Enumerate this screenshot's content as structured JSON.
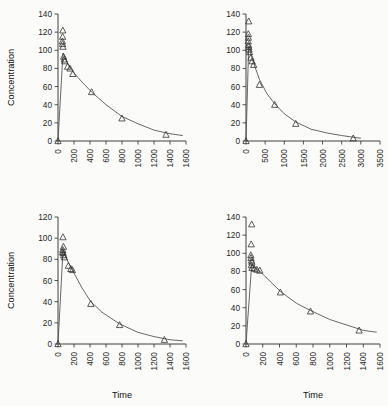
{
  "figure": {
    "marker_shape": "open-triangle",
    "curve_color": "#4d4d4d",
    "marker_color": "#333333",
    "background": "#fbfbf9"
  },
  "chart_data": [
    {
      "type": "scatter",
      "panel": "top-left",
      "title": "",
      "xlabel": "",
      "ylabel": "Concentration",
      "xlim": [
        0,
        1600
      ],
      "ylim": [
        0,
        140
      ],
      "xticks": [
        0,
        200,
        400,
        600,
        800,
        1000,
        1200,
        1400,
        1600
      ],
      "yticks": [
        0,
        20,
        40,
        60,
        80,
        100,
        120,
        140
      ],
      "grid": false,
      "legend": "none",
      "points": [
        {
          "x": 0,
          "y": 0
        },
        {
          "x": 60,
          "y": 122
        },
        {
          "x": 58,
          "y": 115
        },
        {
          "x": 55,
          "y": 110
        },
        {
          "x": 57,
          "y": 107
        },
        {
          "x": 62,
          "y": 104
        },
        {
          "x": 70,
          "y": 93
        },
        {
          "x": 78,
          "y": 90
        },
        {
          "x": 85,
          "y": 88
        },
        {
          "x": 120,
          "y": 82
        },
        {
          "x": 150,
          "y": 80
        },
        {
          "x": 185,
          "y": 74
        },
        {
          "x": 420,
          "y": 54
        },
        {
          "x": 800,
          "y": 25
        },
        {
          "x": 1350,
          "y": 7
        }
      ],
      "fit_curve": {
        "model": "exponential-decay",
        "points": [
          {
            "x": 62,
            "y": 97
          },
          {
            "x": 120,
            "y": 86
          },
          {
            "x": 200,
            "y": 75
          },
          {
            "x": 300,
            "y": 65
          },
          {
            "x": 420,
            "y": 54
          },
          {
            "x": 600,
            "y": 40
          },
          {
            "x": 800,
            "y": 27
          },
          {
            "x": 1000,
            "y": 19
          },
          {
            "x": 1200,
            "y": 12
          },
          {
            "x": 1400,
            "y": 8
          },
          {
            "x": 1560,
            "y": 6
          }
        ]
      }
    },
    {
      "type": "scatter",
      "panel": "top-right",
      "title": "",
      "xlabel": "",
      "ylabel": "",
      "xlim": [
        0,
        3500
      ],
      "ylim": [
        0,
        140
      ],
      "xticks": [
        0,
        500,
        1000,
        1500,
        2000,
        2500,
        3000,
        3500
      ],
      "yticks": [
        0,
        20,
        40,
        60,
        80,
        100,
        120,
        140
      ],
      "grid": false,
      "legend": "none",
      "points": [
        {
          "x": 0,
          "y": 0
        },
        {
          "x": 70,
          "y": 132
        },
        {
          "x": 60,
          "y": 118
        },
        {
          "x": 62,
          "y": 114
        },
        {
          "x": 58,
          "y": 110
        },
        {
          "x": 66,
          "y": 106
        },
        {
          "x": 72,
          "y": 104
        },
        {
          "x": 80,
          "y": 101
        },
        {
          "x": 95,
          "y": 98
        },
        {
          "x": 130,
          "y": 92
        },
        {
          "x": 160,
          "y": 88
        },
        {
          "x": 200,
          "y": 84
        },
        {
          "x": 350,
          "y": 62
        },
        {
          "x": 750,
          "y": 40
        },
        {
          "x": 1300,
          "y": 19
        },
        {
          "x": 2800,
          "y": 3
        }
      ],
      "fit_curve": {
        "model": "exponential-decay",
        "points": [
          {
            "x": 70,
            "y": 104
          },
          {
            "x": 200,
            "y": 86
          },
          {
            "x": 350,
            "y": 68
          },
          {
            "x": 550,
            "y": 52
          },
          {
            "x": 750,
            "y": 41
          },
          {
            "x": 1000,
            "y": 30
          },
          {
            "x": 1300,
            "y": 21
          },
          {
            "x": 1700,
            "y": 13
          },
          {
            "x": 2100,
            "y": 9
          },
          {
            "x": 2500,
            "y": 6
          },
          {
            "x": 3000,
            "y": 3
          }
        ]
      }
    },
    {
      "type": "scatter",
      "panel": "bottom-left",
      "title": "",
      "xlabel": "Time",
      "ylabel": "Concentration",
      "xlim": [
        0,
        1600
      ],
      "ylim": [
        0,
        120
      ],
      "xticks": [
        0,
        200,
        400,
        600,
        800,
        1000,
        1200,
        1400,
        1600
      ],
      "yticks": [
        0,
        20,
        40,
        60,
        80,
        100,
        120
      ],
      "grid": false,
      "legend": "none",
      "points": [
        {
          "x": 0,
          "y": 0
        },
        {
          "x": 62,
          "y": 101
        },
        {
          "x": 68,
          "y": 92
        },
        {
          "x": 60,
          "y": 89
        },
        {
          "x": 58,
          "y": 87
        },
        {
          "x": 64,
          "y": 86
        },
        {
          "x": 70,
          "y": 84
        },
        {
          "x": 80,
          "y": 82
        },
        {
          "x": 130,
          "y": 74
        },
        {
          "x": 160,
          "y": 71
        },
        {
          "x": 180,
          "y": 70
        },
        {
          "x": 410,
          "y": 38
        },
        {
          "x": 770,
          "y": 18
        },
        {
          "x": 1330,
          "y": 4
        }
      ],
      "fit_curve": {
        "model": "exponential-decay",
        "points": [
          {
            "x": 62,
            "y": 88
          },
          {
            "x": 130,
            "y": 77
          },
          {
            "x": 200,
            "y": 67
          },
          {
            "x": 300,
            "y": 53
          },
          {
            "x": 410,
            "y": 40
          },
          {
            "x": 550,
            "y": 30
          },
          {
            "x": 770,
            "y": 19
          },
          {
            "x": 1000,
            "y": 11
          },
          {
            "x": 1200,
            "y": 7
          },
          {
            "x": 1400,
            "y": 4
          },
          {
            "x": 1560,
            "y": 3
          }
        ]
      }
    },
    {
      "type": "scatter",
      "panel": "bottom-right",
      "title": "",
      "xlabel": "Time",
      "ylabel": "",
      "xlim": [
        0,
        1600
      ],
      "ylim": [
        0,
        140
      ],
      "xticks": [
        0,
        200,
        400,
        600,
        800,
        1000,
        1200,
        1400,
        1600
      ],
      "yticks": [
        0,
        20,
        40,
        60,
        80,
        100,
        120,
        140
      ],
      "grid": false,
      "legend": "none",
      "points": [
        {
          "x": 0,
          "y": 0
        },
        {
          "x": 68,
          "y": 132
        },
        {
          "x": 62,
          "y": 110
        },
        {
          "x": 58,
          "y": 98
        },
        {
          "x": 60,
          "y": 95
        },
        {
          "x": 66,
          "y": 92
        },
        {
          "x": 70,
          "y": 90
        },
        {
          "x": 64,
          "y": 87
        },
        {
          "x": 72,
          "y": 84
        },
        {
          "x": 100,
          "y": 83
        },
        {
          "x": 130,
          "y": 82
        },
        {
          "x": 165,
          "y": 81
        },
        {
          "x": 410,
          "y": 57
        },
        {
          "x": 770,
          "y": 36
        },
        {
          "x": 1350,
          "y": 15
        }
      ],
      "fit_curve": {
        "model": "exponential-decay",
        "points": [
          {
            "x": 68,
            "y": 88
          },
          {
            "x": 130,
            "y": 83
          },
          {
            "x": 200,
            "y": 77
          },
          {
            "x": 300,
            "y": 68
          },
          {
            "x": 410,
            "y": 58
          },
          {
            "x": 600,
            "y": 45
          },
          {
            "x": 770,
            "y": 37
          },
          {
            "x": 1000,
            "y": 27
          },
          {
            "x": 1200,
            "y": 21
          },
          {
            "x": 1400,
            "y": 15
          },
          {
            "x": 1560,
            "y": 13
          }
        ]
      }
    }
  ]
}
